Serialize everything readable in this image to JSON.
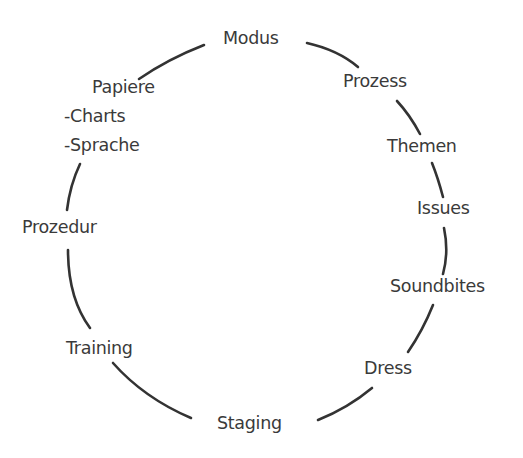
{
  "diagram": {
    "type": "cycle",
    "nodes": [
      {
        "id": "modus",
        "label": "Modus"
      },
      {
        "id": "prozess",
        "label": "Prozess"
      },
      {
        "id": "themen",
        "label": "Themen"
      },
      {
        "id": "issues",
        "label": "Issues"
      },
      {
        "id": "soundbites",
        "label": "Soundbites"
      },
      {
        "id": "dress",
        "label": "Dress"
      },
      {
        "id": "staging",
        "label": "Staging"
      },
      {
        "id": "training",
        "label": "Training"
      },
      {
        "id": "prozedur",
        "label": "Prozedur"
      },
      {
        "id": "papiere",
        "label": "Papiere",
        "subitems": [
          "-Charts",
          "-Sprache"
        ]
      }
    ],
    "colors": {
      "text": "#3a3a3a",
      "stroke": "#333333",
      "background": "#ffffff"
    }
  }
}
